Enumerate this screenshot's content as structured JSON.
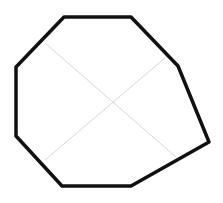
{
  "diagram": {
    "shape": "octagon",
    "stroke_color": "#111111",
    "guide_color": "#d8d8d8",
    "vertices": [
      [
        64,
        17
      ],
      [
        131,
        17
      ],
      [
        178,
        66
      ],
      [
        209,
        142
      ],
      [
        131,
        186
      ],
      [
        62,
        186
      ],
      [
        16,
        136
      ],
      [
        16,
        67
      ]
    ],
    "guides": [
      [
        [
          45,
          43
        ],
        [
          176,
          157
        ]
      ],
      [
        [
          45,
          160
        ],
        [
          165,
          58
        ]
      ]
    ]
  }
}
